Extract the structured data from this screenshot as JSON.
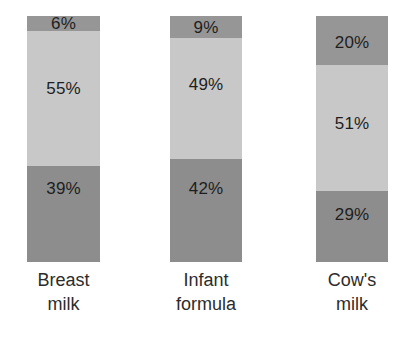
{
  "chart_data": {
    "type": "bar",
    "title": "",
    "subtitle": "",
    "xlabel": "",
    "ylabel": "",
    "ylim": [
      0,
      100
    ],
    "grid": false,
    "legend": "none",
    "stacked": true,
    "orientation": "vertical",
    "units": "%",
    "categories": [
      "Breast milk",
      "Infant formula",
      "Cow's milk"
    ],
    "category_lines": [
      [
        "Breast",
        "milk"
      ],
      [
        "Infant",
        "formula"
      ],
      [
        "Cow's",
        "milk"
      ]
    ],
    "series": [
      {
        "name": "top-segment",
        "values": [
          6,
          55,
          39
        ]
      },
      {
        "name": "middle-segment",
        "values": [
          9,
          49,
          42
        ]
      },
      {
        "name": "bottom-segment",
        "values": [
          20,
          51,
          29
        ]
      }
    ],
    "segment_order": [
      "top-segment",
      "middle-segment",
      "bottom-segment"
    ],
    "bars": [
      {
        "category": "Breast milk",
        "segments": [
          {
            "position": "top",
            "value": 6,
            "label": "6%",
            "color": "#969696"
          },
          {
            "position": "middle",
            "value": 55,
            "label": "55%",
            "color": "#c8c8c8"
          },
          {
            "position": "bottom",
            "value": 39,
            "label": "39%",
            "color": "#8d8d8d"
          }
        ]
      },
      {
        "category": "Infant formula",
        "segments": [
          {
            "position": "top",
            "value": 9,
            "label": "9%",
            "color": "#969696"
          },
          {
            "position": "middle",
            "value": 49,
            "label": "49%",
            "color": "#c8c8c8"
          },
          {
            "position": "bottom",
            "value": 42,
            "label": "42%",
            "color": "#8d8d8d"
          }
        ]
      },
      {
        "category": "Cow's milk",
        "segments": [
          {
            "position": "top",
            "value": 20,
            "label": "20%",
            "color": "#969696"
          },
          {
            "position": "middle",
            "value": 51,
            "label": "51%",
            "color": "#c8c8c8"
          },
          {
            "position": "bottom",
            "value": 29,
            "label": "29%",
            "color": "#8d8d8d"
          }
        ]
      }
    ],
    "colors": {
      "top_segment": "#969696",
      "middle_segment": "#c8c8c8",
      "bottom_segment": "#8d8d8d",
      "background": "#ffffff",
      "text": "#1e1e1e"
    }
  }
}
